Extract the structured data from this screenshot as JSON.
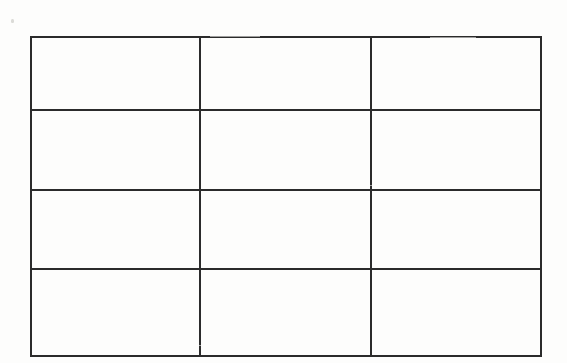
{
  "document": {
    "kind": "scanned-blank-grid-table",
    "background_color": "#fdfdfc",
    "ink_color": "#2b2b2b",
    "page_width": 567,
    "page_height": 363
  },
  "table": {
    "name": "blank-grid-table",
    "row_count": 4,
    "column_count": 3,
    "border_width": 2,
    "bounds": {
      "left": 30,
      "top": 36,
      "width": 510,
      "height": 311
    },
    "column_widths": [
      169,
      171,
      170
    ],
    "row_heights": [
      71,
      78,
      77,
      85
    ],
    "vertical_divider_x": [
      199,
      370
    ],
    "horizontal_divider_y": [
      107,
      185,
      262
    ],
    "rows": [
      {
        "cells": [
          "",
          "",
          ""
        ]
      },
      {
        "cells": [
          "",
          "",
          ""
        ]
      },
      {
        "cells": [
          "",
          "",
          ""
        ]
      },
      {
        "cells": [
          "",
          "",
          ""
        ]
      }
    ]
  },
  "artifacts": {
    "speck_label": ""
  }
}
